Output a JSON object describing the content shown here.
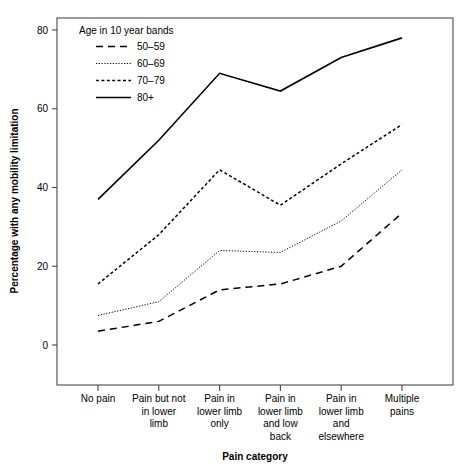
{
  "chart_data": {
    "type": "line",
    "title": "",
    "xlabel": "Pain category",
    "ylabel": "Percentage with any mobility limitation",
    "categories": [
      "No pain",
      "Pain but not in lower limb",
      "Pain in lower limb only",
      "Pain in lower limb and low back",
      "Pain in lower limb and elsewhere",
      "Multiple pains"
    ],
    "category_lines": [
      [
        "No pain"
      ],
      [
        "Pain but not",
        "in lower",
        "limb"
      ],
      [
        "Pain in",
        "lower limb",
        "only"
      ],
      [
        "Pain in",
        "lower limb",
        "and low",
        "back"
      ],
      [
        "Pain in",
        "lower limb",
        "and",
        "elsewhere"
      ],
      [
        "Multiple",
        "pains"
      ]
    ],
    "ylim": [
      0,
      80
    ],
    "yticks": [
      0,
      20,
      40,
      60,
      80
    ],
    "ytick_labels": [
      "0",
      "20",
      "40",
      "60",
      "80"
    ],
    "grid": false,
    "legend_title": "Age in 10 year bands",
    "legend_position": "top-left-inside",
    "series": [
      {
        "name": "50–59",
        "style": "long-dash",
        "values": [
          3.5,
          6,
          14,
          15.5,
          20,
          33.5
        ]
      },
      {
        "name": "60–69",
        "style": "dotted",
        "values": [
          7.5,
          11,
          24,
          23.5,
          31.5,
          44.5
        ]
      },
      {
        "name": "70–79",
        "style": "short-dash",
        "values": [
          15.5,
          28,
          44.5,
          35.5,
          46,
          56
        ]
      },
      {
        "name": "80+",
        "style": "solid",
        "values": [
          37,
          52,
          69,
          64.5,
          73,
          78
        ]
      }
    ]
  }
}
